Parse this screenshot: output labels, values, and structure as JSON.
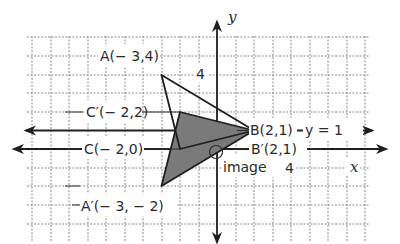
{
  "diagram": {
    "type": "coordinate-plane-reflection",
    "axes": {
      "x_label": "x",
      "y_label": "y",
      "x_tick_label": "4",
      "y_tick_label": "4"
    },
    "reflection_line": {
      "label": "y = 1"
    },
    "original": {
      "A": "A(− 3,4)",
      "B": "B(2,1)",
      "C": "C(− 2,0)"
    },
    "image": {
      "caption": "image",
      "A": "A′(− 3, − 2)",
      "B": "B′(2,1)",
      "C": "C′(− 2,2)"
    },
    "colors": {
      "image_fill": "#7a7a7a",
      "lines": "#1e1e1e",
      "grid": "#8a8a8a"
    }
  }
}
